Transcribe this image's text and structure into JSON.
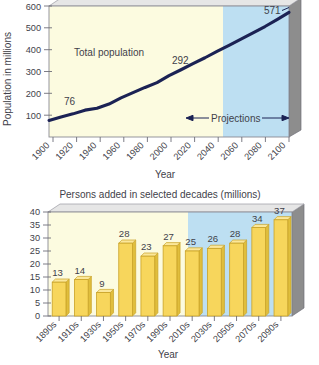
{
  "figure": {
    "background": "#ffffff",
    "palette": {
      "historical_fill": "#FCFBE0",
      "projection_fill": "#BDDFF2",
      "bar_fill": "#F7D65C",
      "bar_edge": "#C9A227",
      "wall_side": "#8D8D8D",
      "wall_top": "#D9D9D9",
      "line_color": "#1B2254",
      "text_color": "#3F3F4A",
      "axis_color": "#6E6E78"
    }
  },
  "chart_data": [
    {
      "type": "line",
      "id": "total-population",
      "title": "",
      "xlabel": "Year",
      "ylabel": "Population in millions",
      "xlim": [
        1900,
        2100
      ],
      "ylim": [
        0,
        600
      ],
      "yticks": [
        100,
        200,
        300,
        400,
        500,
        600
      ],
      "xticks": [
        1900,
        1920,
        1940,
        1960,
        1980,
        2000,
        2020,
        2040,
        2060,
        2080,
        2100
      ],
      "grid": false,
      "legend_position": "none",
      "x": [
        1900,
        1910,
        1920,
        1930,
        1940,
        1950,
        1960,
        1970,
        1980,
        1990,
        2000,
        2010,
        2020,
        2030,
        2040,
        2050,
        2060,
        2070,
        2080,
        2090,
        2100
      ],
      "values": [
        76,
        92,
        106,
        123,
        132,
        151,
        179,
        203,
        227,
        249,
        281,
        308,
        336,
        363,
        392,
        420,
        448,
        477,
        506,
        538,
        571
      ],
      "series": [
        {
          "name": "Total population",
          "values": [
            76,
            92,
            106,
            123,
            132,
            151,
            179,
            203,
            227,
            249,
            281,
            308,
            336,
            363,
            392,
            420,
            448,
            477,
            506,
            538,
            571
          ]
        }
      ],
      "annotations": [
        {
          "label": "76",
          "x": 1900,
          "y": 76
        },
        {
          "label": "292",
          "x": 2005,
          "y": 292
        },
        {
          "label": "571",
          "x": 2100,
          "y": 571
        },
        {
          "label": "Total population",
          "x": 1945,
          "y": 330
        },
        {
          "label": "Projections",
          "x": 2050,
          "y": 130
        }
      ],
      "regions": [
        {
          "name": "historical",
          "from": 1900,
          "to": 2005,
          "fill": "#FCFBE0"
        },
        {
          "name": "projections",
          "from": 2005,
          "to": 2100,
          "fill": "#BDDFF2"
        }
      ]
    },
    {
      "type": "bar",
      "id": "persons-added",
      "title": "Persons added in selected decades (millions)",
      "xlabel": "Year",
      "ylabel": "",
      "ylim": [
        0,
        40
      ],
      "yticks": [
        0,
        5,
        10,
        15,
        20,
        25,
        30,
        35,
        40
      ],
      "grid": false,
      "legend_position": "none",
      "categories": [
        "1890s",
        "1910s",
        "1930s",
        "1950s",
        "1970s",
        "1990s",
        "2010s",
        "2030s",
        "2050s",
        "2070s",
        "2090s"
      ],
      "values": [
        13,
        14,
        9,
        28,
        23,
        27,
        25,
        26,
        28,
        34,
        37
      ],
      "regions": [
        {
          "name": "historical",
          "from_category": "1890s",
          "to_category": "1990s",
          "fill": "#FCFBE0"
        },
        {
          "name": "projections",
          "from_category": "2010s",
          "to_category": "2090s",
          "fill": "#BDDFF2"
        }
      ]
    }
  ],
  "top_chart": {
    "ylabel": "Population in millions",
    "xlabel": "Year",
    "yticks": [
      "600",
      "500",
      "400",
      "300",
      "200",
      "100"
    ],
    "xticks": [
      "1900",
      "1920",
      "1940",
      "1960",
      "1980",
      "2000",
      "2020",
      "2040",
      "2060",
      "2080",
      "2100"
    ],
    "label_total_population": "Total population",
    "label_projections": "Projections",
    "value_start": "76",
    "value_mid": "292",
    "value_end": "571"
  },
  "bottom_chart": {
    "title": "Persons added in selected decades (millions)",
    "xlabel": "Year",
    "yticks": [
      "40",
      "35",
      "30",
      "25",
      "20",
      "15",
      "10",
      "5",
      "0"
    ],
    "xticks": [
      "1890s",
      "1910s",
      "1930s",
      "1950s",
      "1970s",
      "1990s",
      "2010s",
      "2030s",
      "2050s",
      "2070s",
      "2090s"
    ],
    "values": [
      "13",
      "14",
      "9",
      "28",
      "23",
      "27",
      "25",
      "26",
      "28",
      "34",
      "37"
    ]
  }
}
